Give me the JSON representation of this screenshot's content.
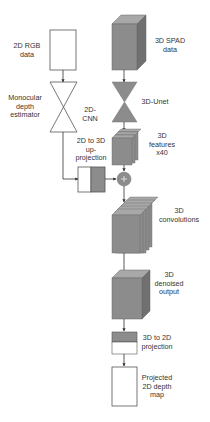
{
  "diagram": {
    "left_branch": {
      "rgb_input": {
        "line1": "2D RGB",
        "line2": "data"
      },
      "estimator": {
        "line1": "Monocular",
        "line2": "depth",
        "line3": "estimator"
      },
      "cnn": {
        "line1": "2D-",
        "line2": "CNN"
      },
      "upprojection": {
        "line1": "2D to 3D",
        "line2": "up-",
        "line3": "projection"
      }
    },
    "right_branch": {
      "spad_input": {
        "line1": "3D SPAD",
        "line2": "data"
      },
      "unet": {
        "label": "3D-Unet"
      },
      "features": {
        "line1": "3D",
        "line2": "features",
        "line3": "x40"
      },
      "fusion": {
        "symbol": "+"
      },
      "convolutions": {
        "line1": "3D",
        "line2": "convolutions"
      },
      "denoised": {
        "line1": "3D",
        "line2": "denoised",
        "line3": "output"
      },
      "projection": {
        "line1": "3D to 2D",
        "line2": "projection"
      },
      "output": {
        "line1": "Projected",
        "line2": "2D depth",
        "line3": "map"
      }
    },
    "colors": {
      "cube_front": "#8c8c8c",
      "cube_top": "#a8a8a8",
      "cube_side": "#707070",
      "stroke": "#555555"
    }
  }
}
